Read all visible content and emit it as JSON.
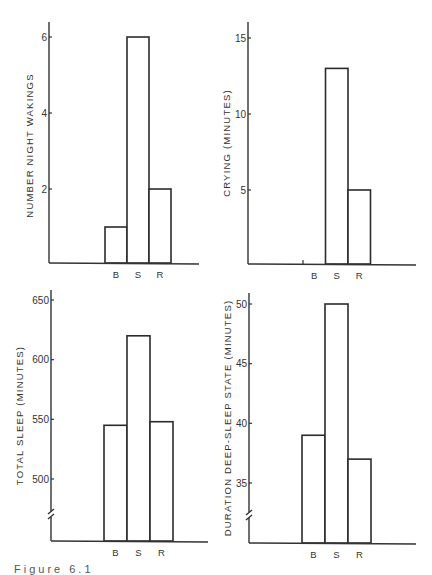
{
  "chart_data": [
    {
      "type": "bar",
      "panel": "top-left",
      "title": "",
      "xlabel": "",
      "ylabel": "NUMBER NIGHT WAKINGS",
      "categories": [
        "B",
        "S",
        "R"
      ],
      "values": [
        1,
        6,
        2
      ],
      "yticks": [
        2,
        4,
        6
      ],
      "ylim": [
        0,
        6.4
      ],
      "axis_break": false,
      "grid": false
    },
    {
      "type": "bar",
      "panel": "top-right",
      "title": "",
      "xlabel": "",
      "ylabel": "CRYING (MINUTES)",
      "categories": [
        "B",
        "S",
        "R"
      ],
      "values": [
        0,
        13,
        5
      ],
      "yticks": [
        5,
        10,
        15
      ],
      "ylim": [
        0,
        16
      ],
      "axis_break": false,
      "grid": false
    },
    {
      "type": "bar",
      "panel": "bottom-left",
      "title": "",
      "xlabel": "",
      "ylabel": "TOTAL SLEEP (MINUTES)",
      "categories": [
        "B",
        "S",
        "R"
      ],
      "values": [
        545,
        620,
        548
      ],
      "yticks": [
        500,
        550,
        600,
        650
      ],
      "ylim": [
        450,
        658
      ],
      "axis_break": true,
      "grid": false
    },
    {
      "type": "bar",
      "panel": "bottom-right",
      "title": "",
      "xlabel": "",
      "ylabel": "DURATION DEEP-SLEEP STATE (MINUTES)",
      "categories": [
        "B",
        "S",
        "R"
      ],
      "values": [
        39,
        50,
        37
      ],
      "yticks": [
        35,
        40,
        45,
        50
      ],
      "ylim": [
        30,
        51
      ],
      "axis_break": true,
      "grid": false
    }
  ],
  "caption": "Figure 6.1"
}
